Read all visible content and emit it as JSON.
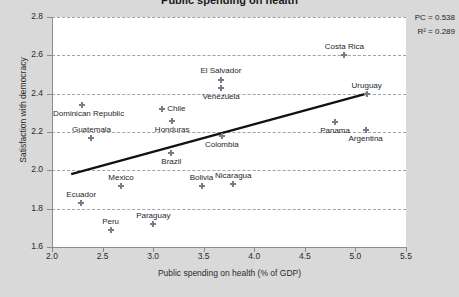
{
  "chart_data": {
    "type": "scatter",
    "title": "Public spending on health",
    "xlabel": "Public spending on health (% of GDP)",
    "ylabel": "Satisfaction with democracy",
    "xlim": [
      2.0,
      5.5
    ],
    "ylim": [
      1.6,
      2.8
    ],
    "xticks": [
      "2.0",
      "2.5",
      "3.0",
      "3.5",
      "4.0",
      "4.5",
      "5.0",
      "5.5"
    ],
    "yticks": [
      "1.6",
      "1.8",
      "2.0",
      "2.2",
      "2.4",
      "2.6",
      "2.8"
    ],
    "grid": "horizontal-dashed",
    "legend": "none",
    "annotations": {
      "pc_label": "PC = 0.538",
      "r2_label": "R² = 0.289",
      "pc_value": 0.538,
      "r2_value": 0.289
    },
    "trendline": {
      "type": "linear",
      "x_start": 2.19,
      "y_start": 1.98,
      "x_end": 5.11,
      "y_end": 2.4
    },
    "points": [
      {
        "label": "Costa Rica",
        "x": 4.89,
        "y": 2.6,
        "label_pos": "above"
      },
      {
        "label": "El Salvador",
        "x": 3.67,
        "y": 2.47,
        "label_pos": "above-far"
      },
      {
        "label": "Venezuela",
        "x": 3.67,
        "y": 2.43,
        "label_pos": "below"
      },
      {
        "label": "Uruguay",
        "x": 5.11,
        "y": 2.4,
        "label_pos": "above"
      },
      {
        "label": "Dominican Republic",
        "x": 2.3,
        "y": 2.34,
        "label_pos": "below"
      },
      {
        "label": "Chile",
        "x": 3.09,
        "y": 2.32,
        "label_pos": "right"
      },
      {
        "label": "Honduras",
        "x": 3.19,
        "y": 2.26,
        "label_pos": "below"
      },
      {
        "label": "Panama",
        "x": 4.8,
        "y": 2.25,
        "label_pos": "below"
      },
      {
        "label": "Argentina",
        "x": 5.1,
        "y": 2.21,
        "label_pos": "below"
      },
      {
        "label": "Guatemala",
        "x": 2.39,
        "y": 2.17,
        "label_pos": "above"
      },
      {
        "label": "Colombia",
        "x": 3.68,
        "y": 2.18,
        "label_pos": "below"
      },
      {
        "label": "Brazil",
        "x": 3.18,
        "y": 2.09,
        "label_pos": "below"
      },
      {
        "label": "Nicaragua",
        "x": 3.79,
        "y": 1.93,
        "label_pos": "above"
      },
      {
        "label": "Bolivia",
        "x": 3.48,
        "y": 1.92,
        "label_pos": "above"
      },
      {
        "label": "Mexico",
        "x": 2.68,
        "y": 1.92,
        "label_pos": "above"
      },
      {
        "label": "Ecuador",
        "x": 2.29,
        "y": 1.83,
        "label_pos": "above"
      },
      {
        "label": "Paraguay",
        "x": 3.0,
        "y": 1.72,
        "label_pos": "above"
      },
      {
        "label": "Peru",
        "x": 2.58,
        "y": 1.69,
        "label_pos": "above"
      }
    ]
  }
}
